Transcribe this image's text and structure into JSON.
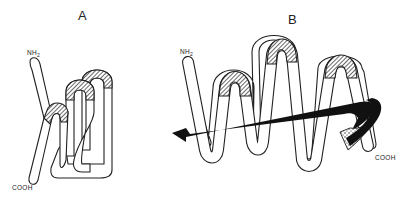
{
  "panels": [
    {
      "label": "A",
      "description": "compact folded chain",
      "n_terminus": {
        "text": "NH",
        "subscript": "2"
      },
      "c_terminus": {
        "text": "COOH"
      }
    },
    {
      "label": "B",
      "description": "extended chain with arrow passing through loops",
      "n_terminus": {
        "text": "NH",
        "subscript": "2"
      },
      "c_terminus": {
        "text": "COOH"
      }
    }
  ],
  "colors": {
    "line": "#222222",
    "hatch": "#555555",
    "arrow": "#111111",
    "background": "#ffffff"
  }
}
